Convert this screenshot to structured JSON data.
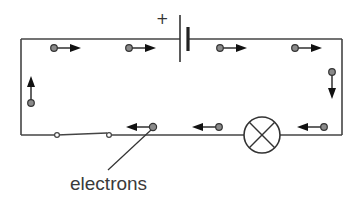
{
  "diagram": {
    "battery": {
      "positive_label": "+"
    },
    "components": [
      "battery",
      "switch",
      "lamp"
    ],
    "callout": {
      "label": "electrons"
    },
    "electron_direction": "from negative terminal around circuit to positive terminal",
    "colors": {
      "wire": "#444444",
      "electron_fill": "#8a8a8a",
      "arrow": "#111111",
      "text": "#3a3a3a"
    }
  }
}
